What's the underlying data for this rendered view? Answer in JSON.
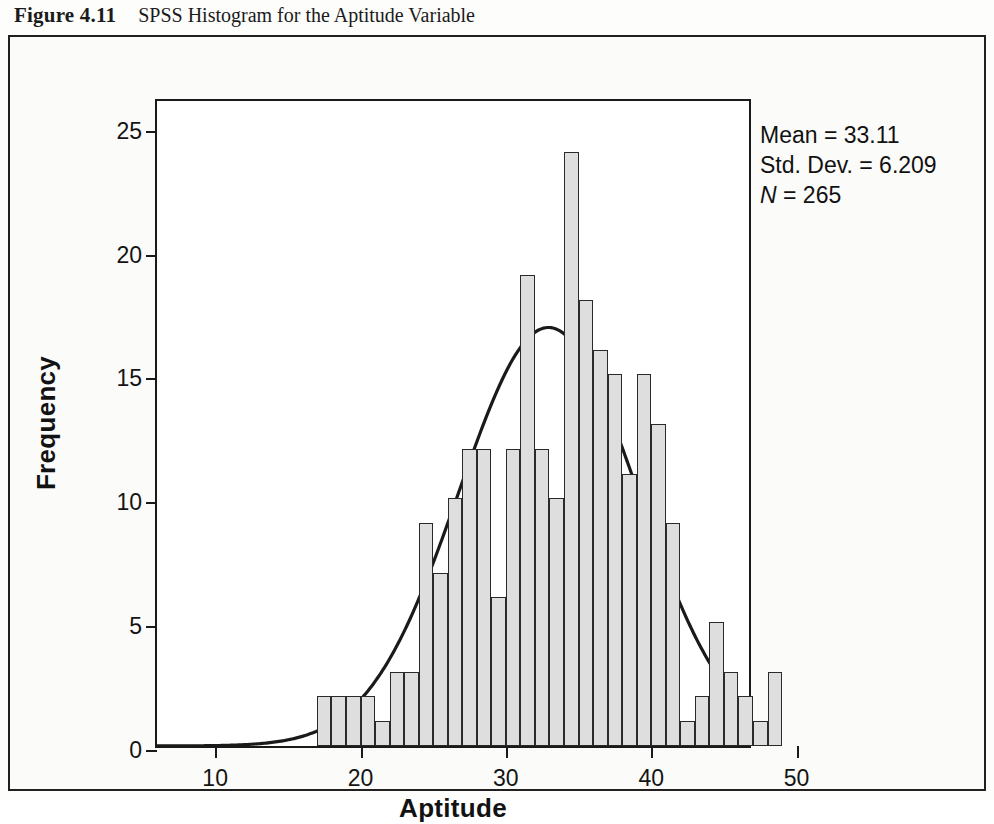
{
  "caption": {
    "figure_number": "Figure 4.11",
    "title": "SPSS Histogram for the Aptitude Variable"
  },
  "stats": {
    "mean_label": "Mean = 33.11",
    "sd_label": "Std. Dev. = 6.209",
    "n_symbol": "N",
    "n_value": " = 265"
  },
  "axes": {
    "ylabel": "Frequency",
    "xlabel": "Aptitude",
    "yticks": [
      0,
      5,
      10,
      15,
      20,
      25
    ],
    "xticks": [
      10,
      20,
      30,
      40,
      50
    ]
  },
  "colors": {
    "bar_fill": "#dedede",
    "bar_stroke": "#2a2a2a",
    "curve": "#1a1a1a",
    "axis": "#1a1a1a",
    "frame": "#221f1f",
    "page_background": "#fbfbfa"
  },
  "chart_data": {
    "type": "bar",
    "title": "SPSS Histogram for the Aptitude Variable",
    "xlabel": "Aptitude",
    "ylabel": "Frequency",
    "xlim": [
      6,
      47
    ],
    "ylim": [
      0,
      26.2
    ],
    "grid": false,
    "legend": null,
    "bin_width": 1,
    "annotations": [
      "Mean = 33.11",
      "Std. Dev. = 6.209",
      "N = 265"
    ],
    "overlay": {
      "type": "normal-curve",
      "mean": 33.11,
      "std_dev": 6.209,
      "n": 265,
      "peak_frequency": 17.0
    },
    "categories": [
      17,
      18,
      19,
      20,
      21,
      22,
      23,
      24,
      25,
      26,
      27,
      28,
      29,
      30,
      31,
      32,
      33,
      34,
      35,
      36,
      37,
      38,
      39,
      40,
      41,
      42,
      43,
      44,
      45,
      46,
      47,
      48
    ],
    "values": [
      2,
      2,
      2,
      2,
      1,
      3,
      3,
      9,
      7,
      10,
      12,
      12,
      6,
      12,
      19,
      12,
      10,
      24,
      18,
      16,
      15,
      11,
      15,
      13,
      9,
      1,
      2,
      5,
      3,
      2,
      1,
      3
    ]
  }
}
